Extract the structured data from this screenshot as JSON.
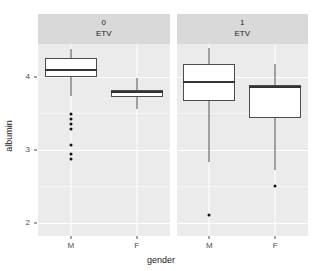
{
  "chart_data": {
    "type": "boxplot",
    "title": "",
    "xlabel": "gender",
    "ylabel": "albumin",
    "ylim": [
      1.82,
      4.45
    ],
    "ytick_values": [
      4,
      3,
      2
    ],
    "ytick_labels": [
      "4",
      "3",
      "2"
    ],
    "xtick_labels": [
      "M",
      "F"
    ],
    "grid": true,
    "legend": "none",
    "facet_variable": "ETV",
    "facets": [
      {
        "strip_value": "0",
        "strip_variable": "ETV",
        "groups": [
          {
            "category": "M",
            "whisker_low": 3.74,
            "q1": 4.0,
            "median": 4.1,
            "q3": 4.26,
            "whisker_high": 4.38,
            "outliers": [
              3.49,
              3.42,
              3.35,
              3.28,
              3.06,
              2.94,
              2.87
            ]
          },
          {
            "category": "F",
            "whisker_low": 3.56,
            "q1": 3.72,
            "median": 3.79,
            "q3": 3.82,
            "whisker_high": 3.99,
            "outliers": []
          }
        ]
      },
      {
        "strip_value": "1",
        "strip_variable": "ETV",
        "groups": [
          {
            "category": "M",
            "whisker_low": 2.84,
            "q1": 3.67,
            "median": 3.93,
            "q3": 4.18,
            "whisker_high": 4.4,
            "outliers": [
              2.11
            ]
          },
          {
            "category": "F",
            "whisker_low": 2.72,
            "q1": 3.44,
            "median": 3.86,
            "q3": 3.89,
            "whisker_high": 4.18,
            "outliers": [
              2.5
            ]
          }
        ]
      }
    ]
  },
  "style": {
    "panel_background": "#ebebeb",
    "strip_background": "#d9d9d9",
    "grid_major_color": "#ffffff",
    "box_fill": "#ffffff",
    "box_outline": "#4d4d4d",
    "median_color": "#333333",
    "outlier_color": "#111111",
    "text_color": "#1a1a1a",
    "axis_text_color": "#4d4d4d"
  }
}
